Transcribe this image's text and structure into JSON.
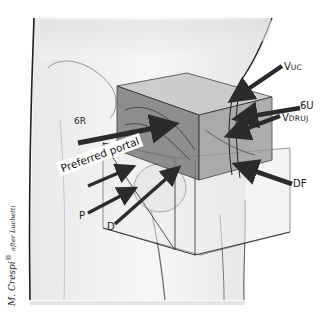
{
  "figure": {
    "type": "anatomical-illustration",
    "labels": {
      "vuc": {
        "main": "V",
        "sub": "UC"
      },
      "six_u": "6U",
      "vdruj": {
        "main": "V",
        "sub": "DRUJ"
      },
      "six_r": "6R",
      "preferred_portal": "Preferred portal",
      "df": "DF",
      "p": "P",
      "d": "D"
    },
    "credit": {
      "author": "M. Crespi",
      "mark": "®",
      "after": "after Luchetti"
    }
  },
  "colors": {
    "background": "#ffffff",
    "skin_light": "#f2f2f2",
    "skin_shade": "#d9d9d9",
    "box_upper": "#8a8a8a",
    "box_upper_top": "#bdbdbd",
    "box_lower": "#e6e6e6",
    "arrow": "#2b2b2b",
    "outline": "#1e1e1e"
  }
}
